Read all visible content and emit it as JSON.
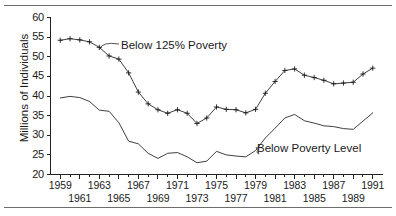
{
  "figure": {
    "name": "poverty-population-line-chart",
    "top_rule": "horizontal-rule",
    "bottom_rule": "horizontal-rule"
  },
  "chart_data": {
    "type": "line",
    "title": "",
    "subtitle": "",
    "xlabel": "",
    "ylabel": "Millions of Individuals",
    "xlim": [
      1958,
      1992
    ],
    "ylim": [
      20,
      60
    ],
    "yticks": [
      20,
      25,
      30,
      35,
      40,
      45,
      50,
      55,
      60
    ],
    "ytick_labels": [
      "20",
      "25",
      "30",
      "35",
      "40",
      "45",
      "50",
      "55",
      "60"
    ],
    "xticks": [
      1959,
      1960,
      1961,
      1962,
      1963,
      1964,
      1965,
      1966,
      1967,
      1968,
      1969,
      1970,
      1971,
      1972,
      1973,
      1974,
      1975,
      1976,
      1977,
      1978,
      1979,
      1980,
      1981,
      1982,
      1983,
      1984,
      1985,
      1986,
      1987,
      1988,
      1989,
      1990,
      1991
    ],
    "xtick_labels_row1": [
      "1959",
      "1963",
      "1967",
      "1971",
      "1975",
      "1979",
      "1983",
      "1987",
      "1991"
    ],
    "xtick_labels_row2": [
      "1961",
      "1965",
      "1969",
      "1973",
      "1977",
      "1981",
      "1985",
      "1989"
    ],
    "grid": false,
    "legend_position": "inline-annotation",
    "marker": "plus",
    "x": [
      1959,
      1960,
      1961,
      1962,
      1963,
      1964,
      1965,
      1966,
      1967,
      1968,
      1969,
      1970,
      1971,
      1972,
      1973,
      1974,
      1975,
      1976,
      1977,
      1978,
      1979,
      1980,
      1981,
      1982,
      1983,
      1984,
      1985,
      1986,
      1987,
      1988,
      1989,
      1990,
      1991
    ],
    "series": [
      {
        "name": "Below 125% Poverty",
        "label": "Below 125% Poverty",
        "marker": "plus",
        "values": [
          54.2,
          54.6,
          54.3,
          53.8,
          52.4,
          50.2,
          49.4,
          45.9,
          41.0,
          38.0,
          36.5,
          35.6,
          36.5,
          35.6,
          33.0,
          34.4,
          37.2,
          36.6,
          36.5,
          35.7,
          36.6,
          40.7,
          43.7,
          46.5,
          46.9,
          45.3,
          44.7,
          44.0,
          43.1,
          43.3,
          43.5,
          45.6,
          47.1
        ]
      },
      {
        "name": "Below Poverty Level",
        "label": "Below Poverty Level",
        "marker": "none",
        "values": [
          39.5,
          39.9,
          39.6,
          38.6,
          36.4,
          36.1,
          33.2,
          28.5,
          27.8,
          25.4,
          24.1,
          25.4,
          25.6,
          24.5,
          23.0,
          23.4,
          25.9,
          25.0,
          24.7,
          24.5,
          26.1,
          29.3,
          31.8,
          34.4,
          35.3,
          33.7,
          33.1,
          32.4,
          32.2,
          31.7,
          31.5,
          33.6,
          35.7
        ]
      }
    ],
    "annotations": [
      {
        "text": "Below 125% Poverty",
        "points_to_series": "Below 125% Poverty",
        "points_to_x": 1963
      },
      {
        "text": "Below Poverty Level",
        "points_to_series": "Below Poverty Level",
        "points_to_x": 1979
      }
    ]
  }
}
